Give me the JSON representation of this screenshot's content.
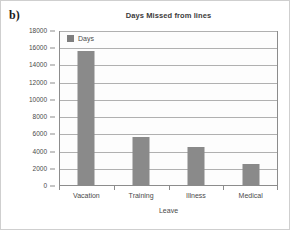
{
  "panel": {
    "label": "b)"
  },
  "chart_data": {
    "type": "bar",
    "title": "Days Missed from lines",
    "xlabel": "Leave",
    "ylabel": "",
    "categories": [
      "Vacation",
      "Training",
      "Illness",
      "Medical"
    ],
    "series": [
      {
        "name": "Days",
        "values": [
          15700,
          5700,
          4500,
          2600
        ]
      }
    ],
    "ylim": [
      0,
      18000
    ],
    "ytick_step": 2000,
    "yticks": [
      0,
      2000,
      4000,
      6000,
      8000,
      10000,
      12000,
      14000,
      16000,
      18000
    ],
    "ytick_labels": [
      "0",
      "2000",
      "4000",
      "6000",
      "8000",
      "10000",
      "12000",
      "14000",
      "16000",
      "18000"
    ],
    "grid": true,
    "legend": {
      "position": "top-left-inside",
      "entries": [
        "Days"
      ]
    },
    "colors": {
      "bar": "#8a8a8a",
      "grid": "#b0b0b0",
      "axis": "#8c8c8c",
      "text": "#4a4a4a"
    }
  }
}
